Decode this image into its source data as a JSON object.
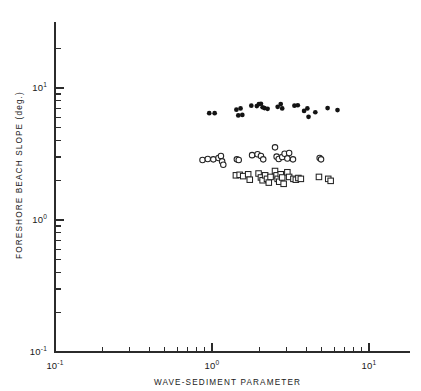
{
  "figure": {
    "background": "#ffffff",
    "ink_color": "#1a1a1a"
  },
  "chart_data": {
    "type": "scatter",
    "title": "",
    "xlabel": "WAVE-SEDIMENT PARAMETER",
    "ylabel": "FORESHORE BEACH SLOPE (deg.)",
    "xscale": "log",
    "yscale": "log",
    "xlim": [
      0.1,
      16.0
    ],
    "ylim": [
      0.1,
      25.0
    ],
    "grid": false,
    "legend_visible": false,
    "xtick_labels": [
      "10-1",
      "100",
      "101"
    ],
    "xtick_values": [
      0.1,
      1.0,
      10.0
    ],
    "ytick_labels": [
      "10-1",
      "100",
      "101"
    ],
    "ytick_values": [
      0.1,
      1.0,
      10.0
    ],
    "xtick_bases": [
      "10",
      "10",
      "10"
    ],
    "xtick_exponents": [
      "-1",
      "0",
      "1"
    ],
    "ytick_bases": [
      "10",
      "10",
      "10"
    ],
    "ytick_exponents": [
      "-1",
      "0",
      "1"
    ],
    "series": [
      {
        "name": "filled-circles",
        "marker": "filled-circle",
        "color": "#131313",
        "points": [
          [
            0.96,
            6.45
          ],
          [
            1.04,
            6.45
          ],
          [
            1.43,
            6.85
          ],
          [
            1.47,
            6.2
          ],
          [
            1.52,
            7.0
          ],
          [
            1.56,
            6.25
          ],
          [
            1.78,
            7.35
          ],
          [
            1.93,
            7.3
          ],
          [
            1.99,
            7.55
          ],
          [
            2.05,
            7.6
          ],
          [
            2.1,
            7.15
          ],
          [
            2.16,
            7.05
          ],
          [
            2.26,
            6.95
          ],
          [
            2.62,
            7.2
          ],
          [
            2.74,
            7.55
          ],
          [
            2.8,
            7.0
          ],
          [
            3.35,
            7.35
          ],
          [
            3.52,
            7.4
          ],
          [
            3.86,
            6.7
          ],
          [
            4.05,
            7.0
          ],
          [
            4.12,
            6.05
          ],
          [
            4.55,
            6.55
          ],
          [
            5.45,
            7.05
          ],
          [
            6.3,
            6.8
          ]
        ]
      },
      {
        "name": "open-circles",
        "marker": "open-circle",
        "color": "#242424",
        "points": [
          [
            0.87,
            2.85
          ],
          [
            0.94,
            2.9
          ],
          [
            1.02,
            2.88
          ],
          [
            1.1,
            2.95
          ],
          [
            1.14,
            3.05
          ],
          [
            1.16,
            2.78
          ],
          [
            1.18,
            2.62
          ],
          [
            1.44,
            2.88
          ],
          [
            1.48,
            2.85
          ],
          [
            1.8,
            3.1
          ],
          [
            1.95,
            3.15
          ],
          [
            2.05,
            3.05
          ],
          [
            2.12,
            2.88
          ],
          [
            2.52,
            3.55
          ],
          [
            2.58,
            3.02
          ],
          [
            2.66,
            2.9
          ],
          [
            2.8,
            3.0
          ],
          [
            2.9,
            3.18
          ],
          [
            3.02,
            2.92
          ],
          [
            3.1,
            3.22
          ],
          [
            3.28,
            2.88
          ],
          [
            4.85,
            2.95
          ],
          [
            4.95,
            2.88
          ]
        ]
      },
      {
        "name": "open-squares",
        "marker": "open-square",
        "color": "#242424",
        "points": [
          [
            1.42,
            2.18
          ],
          [
            1.5,
            2.2
          ],
          [
            1.58,
            2.15
          ],
          [
            1.7,
            2.22
          ],
          [
            1.74,
            2.02
          ],
          [
            1.98,
            2.25
          ],
          [
            2.05,
            2.1
          ],
          [
            2.1,
            2.0
          ],
          [
            2.18,
            2.18
          ],
          [
            2.24,
            2.05
          ],
          [
            2.3,
            1.92
          ],
          [
            2.36,
            2.12
          ],
          [
            2.52,
            2.35
          ],
          [
            2.58,
            2.18
          ],
          [
            2.62,
            2.05
          ],
          [
            2.68,
            1.95
          ],
          [
            2.74,
            2.22
          ],
          [
            2.8,
            2.1
          ],
          [
            2.86,
            1.88
          ],
          [
            3.02,
            2.3
          ],
          [
            3.1,
            2.12
          ],
          [
            3.3,
            2.05
          ],
          [
            3.42,
            2.02
          ],
          [
            3.55,
            2.08
          ],
          [
            3.68,
            2.05
          ],
          [
            4.8,
            2.12
          ],
          [
            5.5,
            2.05
          ],
          [
            5.7,
            1.98
          ]
        ]
      }
    ]
  }
}
